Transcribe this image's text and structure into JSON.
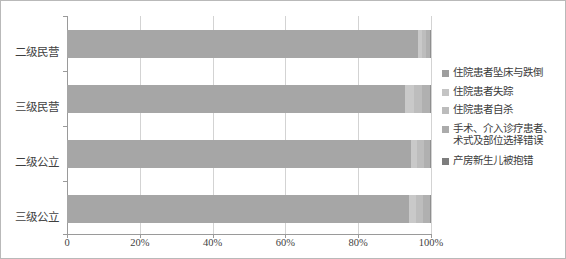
{
  "chart_data": {
    "type": "bar",
    "orientation": "horizontal",
    "stacked": true,
    "normalized_percent": true,
    "title": "",
    "subtitle": "",
    "xlabel": "",
    "ylabel": "",
    "xlim": [
      0,
      100
    ],
    "grid": true,
    "legend_position": "right",
    "categories": [
      "二级民营",
      "三级民营",
      "二级公立",
      "三级公立"
    ],
    "tick_labels": [
      "0",
      "20%",
      "40%",
      "60%",
      "80%",
      "100%"
    ],
    "tick_values": [
      0,
      20,
      40,
      60,
      80,
      100
    ],
    "series": [
      {
        "name": "住院患者坠床与跌倒",
        "color": "#a6a6a6",
        "values": [
          96.4,
          92.9,
          94.5,
          94.0
        ]
      },
      {
        "name": "住院患者失踪",
        "color": "#c9c9c9",
        "values": [
          1.2,
          2.5,
          1.6,
          1.8
        ]
      },
      {
        "name": "住院患者自杀",
        "color": "#bdbdbd",
        "values": [
          1.0,
          2.1,
          2.0,
          2.1
        ]
      },
      {
        "name": "手术、介入诊疗患者、\n术式及部位选择错误",
        "color": "#b0b0b0",
        "values": [
          1.1,
          2.2,
          1.6,
          1.8
        ]
      },
      {
        "name": "产房新生儿被抱错",
        "color": "#8f8f8f",
        "values": [
          0.3,
          0.3,
          0.3,
          0.3
        ]
      }
    ]
  },
  "legend": {
    "items": [
      {
        "label": "住院患者坠床与跌倒",
        "swatch": "#9e9e9e",
        "icon": "square-marker-icon"
      },
      {
        "label": "住院患者失踪",
        "swatch": "#c4c4c4",
        "icon": "square-marker-icon"
      },
      {
        "label": "住院患者自杀",
        "swatch": "#bcbcbc",
        "icon": "square-marker-icon"
      },
      {
        "label": "手术、介入诊疗患者、\n术式及部位选择错误",
        "swatch": "#ababab",
        "icon": "square-marker-icon"
      },
      {
        "label": "产房新生儿被抱错",
        "swatch": "#7d7d7d",
        "icon": "square-marker-icon"
      }
    ]
  },
  "axes": {
    "x_tick_labels": [
      "0",
      "20%",
      "40%",
      "60%",
      "80%",
      "100%"
    ],
    "y_tick_labels": [
      "二级民营",
      "三级民营",
      "二级公立",
      "三级公立"
    ]
  }
}
